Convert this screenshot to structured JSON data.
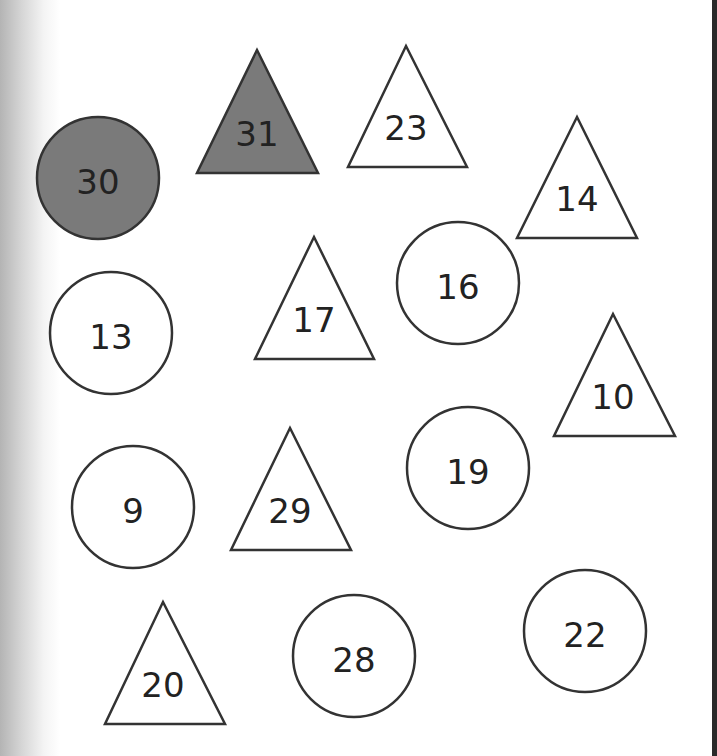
{
  "colors": {
    "outline": "#333333",
    "filled": "#7a7a7a",
    "empty": "#ffffff",
    "text": "#222222"
  },
  "shapes": [
    {
      "type": "circle",
      "label": "30",
      "filled": true,
      "cx": 98,
      "cy": 178,
      "r": 61
    },
    {
      "type": "triangle",
      "label": "31",
      "filled": true,
      "apex": [
        257,
        50
      ],
      "base_y": 173,
      "base_x": [
        197,
        318
      ]
    },
    {
      "type": "triangle",
      "label": "23",
      "filled": false,
      "apex": [
        406,
        46
      ],
      "base_y": 167,
      "base_x": [
        348,
        467
      ]
    },
    {
      "type": "triangle",
      "label": "14",
      "filled": false,
      "apex": [
        577,
        117
      ],
      "base_y": 238,
      "base_x": [
        517,
        637
      ]
    },
    {
      "type": "circle",
      "label": "16",
      "filled": false,
      "cx": 458,
      "cy": 283,
      "r": 61
    },
    {
      "type": "triangle",
      "label": "17",
      "filled": false,
      "apex": [
        314,
        237
      ],
      "base_y": 359,
      "base_x": [
        255,
        374
      ]
    },
    {
      "type": "circle",
      "label": "13",
      "filled": false,
      "cx": 111,
      "cy": 333,
      "r": 61
    },
    {
      "type": "triangle",
      "label": "10",
      "filled": false,
      "apex": [
        613,
        314
      ],
      "base_y": 436,
      "base_x": [
        554,
        675
      ]
    },
    {
      "type": "circle",
      "label": "19",
      "filled": false,
      "cx": 468,
      "cy": 468,
      "r": 61
    },
    {
      "type": "circle",
      "label": "9",
      "filled": false,
      "cx": 133,
      "cy": 507,
      "r": 61
    },
    {
      "type": "triangle",
      "label": "29",
      "filled": false,
      "apex": [
        290,
        428
      ],
      "base_y": 550,
      "base_x": [
        231,
        351
      ]
    },
    {
      "type": "triangle",
      "label": "20",
      "filled": false,
      "apex": [
        163,
        602
      ],
      "base_y": 724,
      "base_x": [
        105,
        225
      ]
    },
    {
      "type": "circle",
      "label": "28",
      "filled": false,
      "cx": 354,
      "cy": 656,
      "r": 61
    },
    {
      "type": "circle",
      "label": "22",
      "filled": false,
      "cx": 585,
      "cy": 631,
      "r": 61
    }
  ]
}
